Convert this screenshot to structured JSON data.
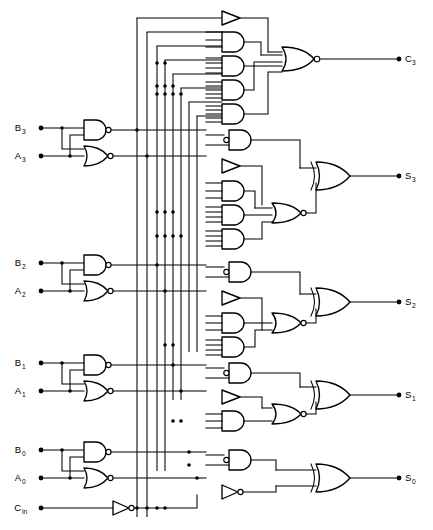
{
  "figure": {
    "kind": "logic-circuit-schematic",
    "width": 433,
    "height": 530,
    "background_color": "#ffffff",
    "line_color": "#000000"
  },
  "inputs": [
    {
      "id": "B3",
      "base": "B",
      "sub": "3",
      "label": "B3",
      "x": 24,
      "y": 128
    },
    {
      "id": "A3",
      "base": "A",
      "sub": "3",
      "label": "A3",
      "x": 24,
      "y": 156
    },
    {
      "id": "B2",
      "base": "B",
      "sub": "2",
      "label": "B2",
      "x": 24,
      "y": 263
    },
    {
      "id": "A2",
      "base": "A",
      "sub": "2",
      "label": "A2",
      "x": 24,
      "y": 291
    },
    {
      "id": "B1",
      "base": "B",
      "sub": "1",
      "label": "B1",
      "x": 24,
      "y": 363
    },
    {
      "id": "A1",
      "base": "A",
      "sub": "1",
      "label": "A1",
      "x": 24,
      "y": 391
    },
    {
      "id": "B0",
      "base": "B",
      "sub": "0",
      "label": "B0",
      "x": 24,
      "y": 450
    },
    {
      "id": "A0",
      "base": "A",
      "sub": "0",
      "label": "A0",
      "x": 24,
      "y": 478
    },
    {
      "id": "Cin",
      "base": "C",
      "sub": "in",
      "label": "Cin",
      "x": 24,
      "y": 508
    }
  ],
  "outputs": [
    {
      "id": "C3",
      "base": "C",
      "sub": "3",
      "label": "C3",
      "x": 404,
      "y": 59
    },
    {
      "id": "S3",
      "base": "S",
      "sub": "3",
      "label": "S3",
      "x": 404,
      "y": 176
    },
    {
      "id": "S2",
      "base": "S",
      "sub": "2",
      "label": "S2",
      "x": 404,
      "y": 302
    },
    {
      "id": "S1",
      "base": "S",
      "sub": "1",
      "label": "S1",
      "x": 404,
      "y": 395
    },
    {
      "id": "S0",
      "base": "S",
      "sub": "0",
      "label": "S0",
      "x": 404,
      "y": 478
    }
  ],
  "input_stages": [
    {
      "name": "bit3",
      "nand_label": "NAND",
      "nor_label": "NOR",
      "bits": "B3,A3"
    },
    {
      "name": "bit2",
      "nand_label": "NAND",
      "nor_label": "NOR",
      "bits": "B2,A2"
    },
    {
      "name": "bit1",
      "nand_label": "NAND",
      "nor_label": "NOR",
      "bits": "B1,A1"
    },
    {
      "name": "bit0",
      "nand_label": "NAND",
      "nor_label": "NOR",
      "bits": "B0,A0"
    }
  ],
  "gate_counts": {
    "nand": 4,
    "nor_input_stage": 4,
    "and": 14,
    "nor_logic": 4,
    "xor": 4,
    "buffer": 4,
    "inverter": 2,
    "total": 36
  },
  "blocks": [
    {
      "name": "carry-out-block",
      "output": "C3",
      "buffers": 1,
      "and_gates": 4,
      "combiner": "NOR",
      "xor": 0
    },
    {
      "name": "sum3-block",
      "output": "S3",
      "and_bubble_gates": 1,
      "buffers": 1,
      "and_gates": 3,
      "combiner": "NOR",
      "xor": 1
    },
    {
      "name": "sum2-block",
      "output": "S2",
      "and_bubble_gates": 1,
      "buffers": 1,
      "and_gates": 2,
      "combiner": "NOR",
      "xor": 1
    },
    {
      "name": "sum1-block",
      "output": "S1",
      "and_bubble_gates": 1,
      "buffers": 1,
      "and_gates": 1,
      "combiner": "NOR",
      "xor": 1
    },
    {
      "name": "sum0-block",
      "output": "S0",
      "and_bubble_gates": 1,
      "inverters": 1,
      "and_gates": 0,
      "combiner": "none",
      "xor": 1
    },
    {
      "name": "carry-in-inverter",
      "output": "Cin-bar",
      "inverters": 1
    }
  ]
}
